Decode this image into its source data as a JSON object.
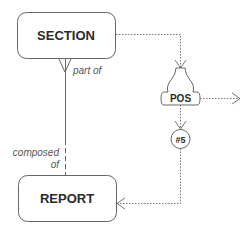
{
  "diagram": {
    "type": "entity-relationship",
    "colors": {
      "stroke": "#666666",
      "text": "#2a2a2a",
      "label": "#555555",
      "background": "#ffffff"
    },
    "entities": [
      {
        "id": "section",
        "label": "SECTION"
      },
      {
        "id": "report",
        "label": "REPORT"
      }
    ],
    "relationship": {
      "from": "SECTION",
      "to": "REPORT",
      "label_top": "part of",
      "label_bottom_line1": "composed",
      "label_bottom_line2": "of",
      "section_end_notation": "crow-foot (many)",
      "report_end_notation": "none"
    },
    "nodes": [
      {
        "id": "pos",
        "label": "POS",
        "shape": "bell"
      },
      {
        "id": "step5",
        "label": "#5",
        "shape": "circle"
      }
    ],
    "flows": [
      {
        "from": "SECTION",
        "to": "POS",
        "style": "dotted",
        "arrow": "open"
      },
      {
        "from": "POS",
        "to": "exit-right",
        "style": "dotted",
        "arrow": "open"
      },
      {
        "from": "POS",
        "to": "#5",
        "style": "dotted",
        "arrow": "open"
      },
      {
        "from": "#5",
        "to": "REPORT",
        "style": "dotted",
        "arrow": "open"
      }
    ]
  }
}
